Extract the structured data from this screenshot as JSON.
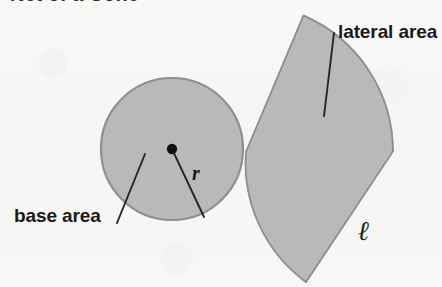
{
  "figure": {
    "cropped_title": "Net of a Cone",
    "background_color": "#f7f7f6",
    "fill_color": "#b9b9b9",
    "stroke_color": "#8f8f8f",
    "ink_color": "#1a1a1a"
  },
  "labels": {
    "lateral_area": "lateral area",
    "base_area": "base area",
    "radius": "r",
    "slant_height": "ℓ"
  },
  "shapes": {
    "base_circle": {
      "name": "base circle",
      "center_x": 172,
      "center_y": 149,
      "radius": 71
    },
    "lateral_sector": {
      "name": "lateral sector",
      "apex_x": 246,
      "apex_y": 152,
      "radius": 148,
      "start_angle_deg": -115,
      "end_angle_deg": 60
    },
    "center_dot": {
      "name": "center point",
      "x": 172,
      "y": 149,
      "radius": 5
    }
  },
  "leader_lines": {
    "base_area_line": {
      "x1": 145,
      "y1": 154,
      "x2": 117,
      "y2": 223
    },
    "lateral_area_line": {
      "x1": 334,
      "y1": 33,
      "x2": 324,
      "y2": 116
    },
    "radius_line": {
      "x1": 172,
      "y1": 149,
      "x2": 204,
      "y2": 217
    }
  }
}
